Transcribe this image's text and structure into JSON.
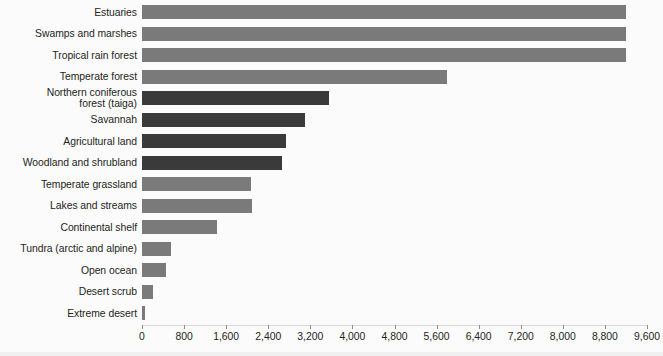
{
  "chart_data": {
    "type": "bar",
    "orientation": "horizontal",
    "title": "",
    "subtitle": "",
    "xlabel": "",
    "ylabel": "",
    "xlim": [
      0,
      9600
    ],
    "ylim": null,
    "grid": false,
    "legend": null,
    "xticks": [
      "0",
      "800",
      "1,600",
      "2,400",
      "3,200",
      "4,000",
      "4,800",
      "5,600",
      "6,400",
      "7,200",
      "8,000",
      "8,800",
      "9,600"
    ],
    "xtick_values": [
      0,
      800,
      1600,
      2400,
      3200,
      4000,
      4800,
      5600,
      6400,
      7200,
      8000,
      8800,
      9600
    ],
    "categories": [
      "Estuaries",
      "Swamps and marshes",
      "Tropical rain forest",
      "Temperate forest",
      "Northern coniferous\nforest (taiga)",
      "Savannah",
      "Agricultural land",
      "Woodland and shrubland",
      "Temperate grassland",
      "Lakes and streams",
      "Continental shelf",
      "Tundra (arctic and alpine)",
      "Open ocean",
      "Desert scrub",
      "Extreme desert"
    ],
    "values": [
      9200,
      9200,
      9200,
      5800,
      3550,
      3100,
      2740,
      2660,
      2080,
      2100,
      1420,
      550,
      450,
      200,
      50
    ],
    "bar_colors": [
      "#7a7a7a",
      "#7a7a7a",
      "#7a7a7a",
      "#7a7a7a",
      "#3a3a3a",
      "#3a3a3a",
      "#3a3a3a",
      "#3a3a3a",
      "#7a7a7a",
      "#7a7a7a",
      "#7a7a7a",
      "#7a7a7a",
      "#7a7a7a",
      "#7a7a7a",
      "#7a7a7a"
    ]
  },
  "colors": {
    "light_bar": "#7a7a7a",
    "dark_bar": "#3a3a3a",
    "background": "#fbfbfb",
    "text": "#231f20",
    "axis": "#8d8d8d"
  }
}
